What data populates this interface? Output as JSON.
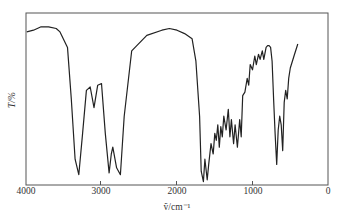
{
  "chart_data": {
    "type": "line",
    "title": "",
    "xlabel": "ṽ/cm⁻¹",
    "ylabel": "T/%",
    "xlim": [
      4000,
      0
    ],
    "x_reversed": true,
    "ylim": [
      0,
      100
    ],
    "grid": false,
    "legend": null,
    "x_ticks": [
      4000,
      3000,
      2000,
      1000,
      0
    ],
    "x_tick_labels": [
      "4000",
      "3000",
      "2000",
      "1000",
      "0"
    ],
    "y_ticks": [],
    "series": [
      {
        "name": "IR spectrum",
        "x": [
          3990,
          3900,
          3800,
          3700,
          3600,
          3550,
          3450,
          3400,
          3350,
          3300,
          3250,
          3200,
          3150,
          3100,
          3050,
          3000,
          2950,
          2900,
          2870,
          2850,
          2800,
          2750,
          2700,
          2600,
          2400,
          2200,
          2100,
          2000,
          1900,
          1800,
          1750,
          1700,
          1680,
          1650,
          1630,
          1600,
          1580,
          1550,
          1520,
          1500,
          1480,
          1460,
          1440,
          1420,
          1400,
          1380,
          1350,
          1320,
          1300,
          1280,
          1250,
          1230,
          1200,
          1170,
          1150,
          1130,
          1100,
          1070,
          1050,
          1030,
          1000,
          970,
          950,
          920,
          900,
          870,
          850,
          820,
          800,
          780,
          760,
          740,
          720,
          700,
          680,
          660,
          640,
          620,
          600,
          580,
          560,
          540,
          520,
          500,
          450,
          400
        ],
        "y": [
          89,
          90,
          92,
          92,
          91,
          89,
          80,
          50,
          15,
          6,
          30,
          55,
          57,
          45,
          58,
          59,
          30,
          7,
          18,
          22,
          10,
          6,
          40,
          78,
          87,
          90,
          91,
          90,
          88,
          85,
          72,
          40,
          8,
          2,
          15,
          3,
          12,
          24,
          18,
          30,
          26,
          35,
          22,
          34,
          28,
          40,
          32,
          44,
          28,
          38,
          24,
          35,
          22,
          38,
          28,
          52,
          54,
          62,
          58,
          70,
          67,
          75,
          70,
          76,
          73,
          78,
          73,
          80,
          81,
          81,
          80,
          72,
          50,
          30,
          12,
          32,
          40,
          35,
          20,
          48,
          55,
          50,
          62,
          68,
          75,
          82
        ]
      }
    ],
    "annotations": []
  },
  "axes": {
    "x_tick_labels": [
      "4000",
      "3000",
      "2000",
      "1000",
      "0"
    ],
    "xlabel": "ṽ/cm⁻¹",
    "ylabel": "T/%"
  }
}
